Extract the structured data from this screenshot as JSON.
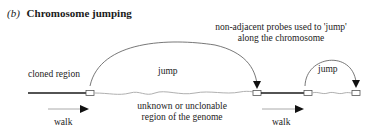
{
  "title": {
    "label": "(b)",
    "text": "Chromosome jumping"
  },
  "annotations": {
    "probes_note_line1": "non-adjacent probes used to 'jump'",
    "probes_note_line2": "along the chromosome",
    "cloned_region": "cloned region",
    "jump_1": "jump",
    "jump_2": "jump",
    "unknown_line1": "unknown or unclonable",
    "unknown_line2": "region of  the genome",
    "walk_1": "walk",
    "walk_2": "walk"
  },
  "colors": {
    "cloned_line": "#1a1a1a",
    "unknown_line": "#b0b0b0",
    "arc": "#555555",
    "arrowhead": "#111111"
  }
}
